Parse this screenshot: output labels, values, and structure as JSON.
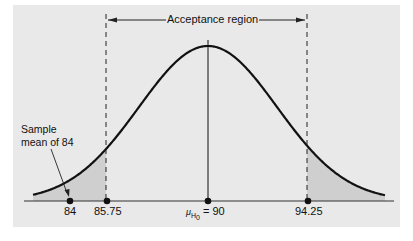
{
  "diagram": {
    "title_label": "Acceptance region",
    "annotation": {
      "line1": "Sample",
      "line2": "mean of 84"
    },
    "mean_label": {
      "symbol": "μ",
      "subscript": "H",
      "subsub": "0",
      "text": "= 90"
    },
    "points": [
      {
        "label": "84",
        "value": 84
      },
      {
        "label": "85.75",
        "value": 85.75
      },
      {
        "label": "90",
        "value": 90
      },
      {
        "label": "94.25",
        "value": 94.25
      }
    ],
    "tick_labels": {
      "p0": "84",
      "p1": "85.75",
      "p3": "94.25"
    },
    "distribution": "normal",
    "critical_values": [
      85.75,
      94.25
    ],
    "shaded": "rejection tails"
  }
}
